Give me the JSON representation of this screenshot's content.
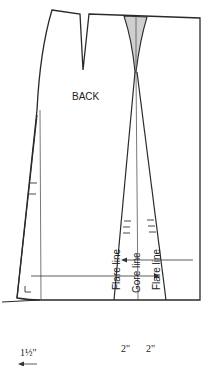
{
  "figure": {
    "piece_label": "BACK",
    "lines": {
      "flare_left": "Flare line",
      "gore": "Gore line",
      "flare_right": "Flare line"
    },
    "measurements": {
      "left_extension": "1½\"",
      "left_flare_spread": "2\"",
      "right_flare_spread": "2\""
    },
    "colors": {
      "outline": "#2a2a2a",
      "dart_shade": "#cfcfcf",
      "background": "#ffffff"
    }
  }
}
